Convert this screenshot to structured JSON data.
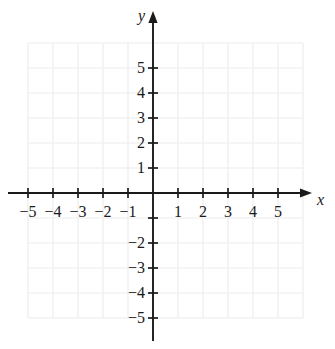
{
  "figure": {
    "kind": "cartesian-coordinate-plane",
    "background_color": "#ffffff",
    "axis_color": "#1a1a1a",
    "grid_color": "#f2f2f2",
    "label_color": "#1a1a1a"
  },
  "axes": {
    "x_axis_name": "x",
    "y_axis_name": "y",
    "origin_px": {
      "x": 153,
      "y": 193
    },
    "unit_px": 25,
    "x_range": [
      -5.8,
      6.4
    ],
    "y_range": [
      -6.0,
      7.2
    ],
    "x_axis_arrow": "right",
    "y_axis_arrow": "up"
  },
  "grid": {
    "visible": true,
    "spacing_units": 1,
    "x_lines": [
      -5,
      -4,
      -3,
      -2,
      -1,
      0,
      1,
      2,
      3,
      4,
      5,
      6
    ],
    "y_lines": [
      -5,
      -4,
      -3,
      -2,
      -1,
      0,
      1,
      2,
      3,
      4,
      5,
      6
    ]
  },
  "ticks": {
    "x_values": [
      -5,
      -4,
      -3,
      -2,
      -1,
      1,
      2,
      3,
      4,
      5
    ],
    "y_values": [
      -5,
      -4,
      -3,
      -2,
      -1,
      1,
      2,
      3,
      4,
      5
    ],
    "half_length_px": 5
  },
  "labels": {
    "x": [
      {
        "value": -5,
        "text": "−5"
      },
      {
        "value": -4,
        "text": "−4"
      },
      {
        "value": -3,
        "text": "−3"
      },
      {
        "value": -2,
        "text": "−2"
      },
      {
        "value": -1,
        "text": "−1"
      },
      {
        "value": 1,
        "text": "1"
      },
      {
        "value": 2,
        "text": "2"
      },
      {
        "value": 3,
        "text": "3"
      },
      {
        "value": 4,
        "text": "4"
      },
      {
        "value": 5,
        "text": "5"
      }
    ],
    "y": [
      {
        "value": 5,
        "text": "5"
      },
      {
        "value": 4,
        "text": "4"
      },
      {
        "value": 3,
        "text": "3"
      },
      {
        "value": 2,
        "text": "2"
      },
      {
        "value": 1,
        "text": "1"
      },
      {
        "value": -2,
        "text": "−2"
      },
      {
        "value": -3,
        "text": "−3"
      },
      {
        "value": -4,
        "text": "−4"
      },
      {
        "value": -5,
        "text": "−5"
      }
    ]
  },
  "plotted": {
    "points": [],
    "curves": []
  }
}
